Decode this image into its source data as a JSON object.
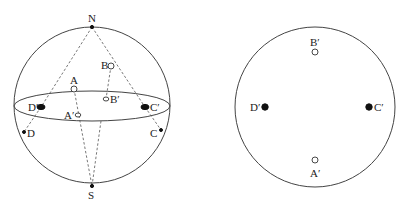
{
  "diagram": {
    "left_figure": {
      "name": "sphere-with-equatorial-plane",
      "sphere": {
        "cx": 92,
        "cy": 105,
        "r": 78
      },
      "equator": {
        "cx": 92,
        "cy": 106,
        "rx": 78,
        "ry": 15
      },
      "points": {
        "N": {
          "label": "N",
          "x": 92,
          "y": 27,
          "style": "solid-small"
        },
        "S": {
          "label": "S",
          "x": 92,
          "y": 186,
          "style": "solid-small"
        },
        "A": {
          "label": "A",
          "x": 74,
          "y": 89,
          "style": "open"
        },
        "A_prime": {
          "label": "A′",
          "x": 78,
          "y": 115,
          "style": "open-small"
        },
        "B": {
          "label": "B",
          "x": 111,
          "y": 66,
          "style": "open"
        },
        "B_prime": {
          "label": "B′",
          "x": 106,
          "y": 99,
          "style": "open-small"
        },
        "C": {
          "label": "C",
          "x": 161,
          "y": 130,
          "style": "solid-small"
        },
        "C_prime": {
          "label": "C′",
          "x": 145,
          "y": 107,
          "style": "solid-large"
        },
        "D": {
          "label": "D",
          "x": 24,
          "y": 132,
          "style": "solid-small"
        },
        "D_prime": {
          "label": "D′",
          "x": 41,
          "y": 107,
          "style": "solid-large"
        }
      }
    },
    "right_figure": {
      "name": "equatorial-disk-projection",
      "circle": {
        "cx": 315,
        "cy": 107,
        "r": 80
      },
      "points": {
        "A_prime": {
          "label": "A′",
          "x": 315,
          "y": 160,
          "style": "open"
        },
        "B_prime": {
          "label": "B′",
          "x": 315,
          "y": 52,
          "style": "open"
        },
        "C_prime": {
          "label": "C′",
          "x": 369,
          "y": 107,
          "style": "solid"
        },
        "D_prime": {
          "label": "D′",
          "x": 265,
          "y": 107,
          "style": "solid"
        }
      }
    },
    "colors": {
      "stroke": "#444444",
      "fill_solid": "#111111",
      "background": "#ffffff"
    }
  }
}
